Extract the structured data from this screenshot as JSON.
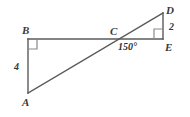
{
  "figure": {
    "type": "geometry-diagram",
    "background_color": "#ffffff",
    "stroke_color": "#5a5a5a",
    "label_color": "#3a3a3a",
    "stroke_width": 1.4
  },
  "points": {
    "A": {
      "label": "A",
      "x": 28,
      "y": 93
    },
    "B": {
      "label": "B",
      "x": 28,
      "y": 39
    },
    "C": {
      "label": "C",
      "x": 116,
      "y": 39
    },
    "D": {
      "label": "D",
      "x": 163,
      "y": 13
    },
    "E": {
      "label": "E",
      "x": 163,
      "y": 39
    }
  },
  "segments": [
    {
      "name": "AB",
      "from": "A",
      "to": "B"
    },
    {
      "name": "BE",
      "from": "B",
      "to": "E"
    },
    {
      "name": "AD",
      "from": "A",
      "to": "D"
    },
    {
      "name": "DE",
      "from": "D",
      "to": "E"
    }
  ],
  "right_angles": [
    {
      "name": "right-angle-B",
      "at": "B",
      "size": 9
    },
    {
      "name": "right-angle-E",
      "at": "E",
      "size": 9
    }
  ],
  "measures": {
    "side_AB": "4",
    "side_DE": "2",
    "angle_at_C": "150°"
  }
}
